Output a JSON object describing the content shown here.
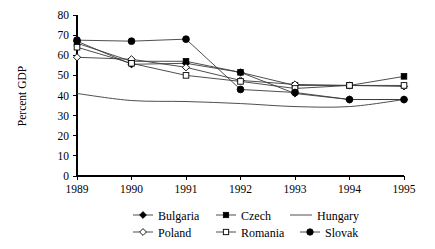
{
  "chart_data": {
    "type": "line",
    "title": "",
    "subtitle": "",
    "xlabel": "",
    "ylabel": "Percent GDP",
    "x": [
      1989,
      1990,
      1991,
      1992,
      1993,
      1994,
      1995
    ],
    "categories": [
      "1989",
      "1990",
      "1991",
      "1992",
      "1993",
      "1994",
      "1995"
    ],
    "xlim": [
      1989,
      1995
    ],
    "ylim": [
      0,
      80
    ],
    "yticks": [
      0,
      10,
      20,
      30,
      40,
      50,
      60,
      70,
      80
    ],
    "ytick_labels": [
      "0",
      "10",
      "20",
      "30",
      "40",
      "50",
      "60",
      "70",
      "80"
    ],
    "xtick_labels": [
      "1989",
      "1990",
      "1991",
      "1992",
      "1993",
      "1994",
      "1995"
    ],
    "grid": false,
    "legend_position": "bottom",
    "series": [
      {
        "name": "Bulgaria",
        "marker": "filled-diamond",
        "values": [
          67,
          55.5,
          56,
          51.5,
          41,
          38,
          38
        ]
      },
      {
        "name": "Czech",
        "marker": "filled-square",
        "values": [
          66,
          57,
          57,
          51.5,
          45,
          45,
          49.5
        ]
      },
      {
        "name": "Hungary",
        "marker": "none",
        "values": [
          41,
          37.5,
          37,
          36,
          34.5,
          34.5,
          38
        ]
      },
      {
        "name": "Poland",
        "marker": "open-diamond",
        "values": [
          59,
          58,
          54,
          47.5,
          45.5,
          45,
          44.5
        ]
      },
      {
        "name": "Romania",
        "marker": "open-square",
        "values": [
          64,
          56,
          50,
          47,
          43.5,
          45,
          45
        ]
      },
      {
        "name": "Slovak",
        "marker": "filled-circle",
        "values": [
          67.5,
          67,
          68,
          43,
          41.5,
          38,
          38
        ]
      }
    ]
  },
  "legend": {
    "rows": [
      [
        "Bulgaria",
        "Czech",
        "Hungary"
      ],
      [
        "Poland",
        "Romania",
        "Slovak"
      ]
    ]
  },
  "colors": {
    "axis": "#000000",
    "line": "#3a3a3a",
    "marker_fill": "#000000",
    "marker_open_fill": "#ffffff",
    "background": "#ffffff"
  }
}
